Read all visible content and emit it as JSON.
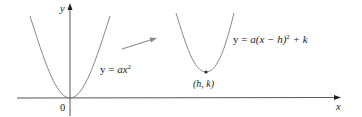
{
  "diagram": {
    "axes": {
      "x_label": "x",
      "y_label": "y",
      "origin_label": "0"
    },
    "curves": [
      {
        "id": "base-parabola",
        "equation": {
          "lhs": "y",
          "eq": "=",
          "rhs_main": "ax",
          "rhs_exp": "2",
          "full": "y = ax²"
        },
        "vertex": [
          0,
          0
        ]
      },
      {
        "id": "shifted-parabola",
        "equation": {
          "lhs": "y",
          "eq": "=",
          "rhs_pre": "a(x − h)",
          "rhs_exp": "2",
          "rhs_post": " + k",
          "full": "y = a(x − h)² + k"
        },
        "vertex_label": "(h, k)"
      }
    ],
    "transform_arrow": {
      "description": "gray arrow indicating shift from base parabola to shifted parabola",
      "color": "#8a8a8a"
    },
    "colors": {
      "curve": "#7a7a7a",
      "axis": "#333333",
      "text": "#222222",
      "vertex_dot": "#333333"
    }
  }
}
